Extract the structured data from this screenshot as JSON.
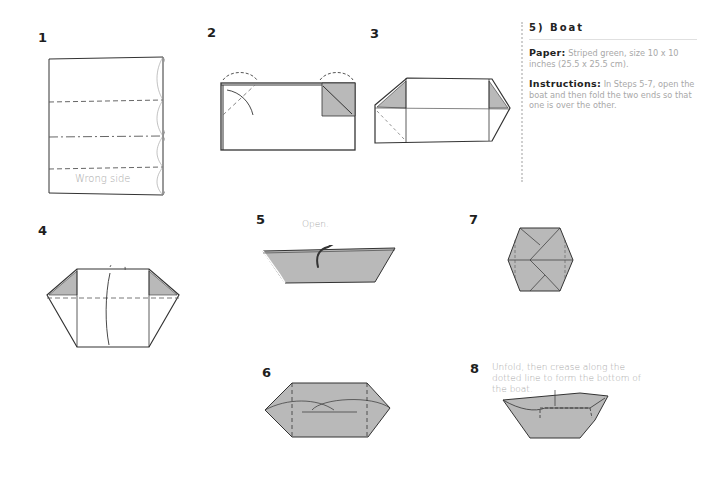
{
  "sidebar": {
    "title": "5) Boat",
    "paper_label": "Paper:",
    "paper_text": "Striped green, size 10 x 10 inches (25.5 x 25.5 cm).",
    "instructions_label": "Instructions:",
    "instructions_text": "In Steps 5-7, open the boat and then fold the two ends so that one is over the other."
  },
  "steps": [
    {
      "number": "1",
      "caption": "Wrong side"
    },
    {
      "number": "2"
    },
    {
      "number": "3"
    },
    {
      "number": "4"
    },
    {
      "number": "5",
      "caption": "Open."
    },
    {
      "number": "6"
    },
    {
      "number": "7"
    },
    {
      "number": "8",
      "caption": "Unfold, then crease along the dotted line to form the bottom of the boat."
    }
  ],
  "colors": {
    "paper_fill": "#b9b9b9",
    "line": "#2a2a2a",
    "caption": "#a8a8a8"
  }
}
